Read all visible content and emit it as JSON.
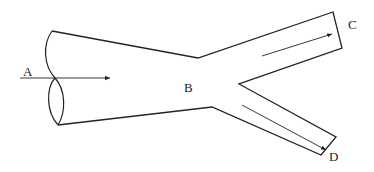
{
  "diagram": {
    "type": "branching pipe flow",
    "labels": {
      "A": "A",
      "B": "B",
      "C": "C",
      "D": "D"
    },
    "arrows": [
      {
        "name": "flow-arrow-a",
        "from": "inlet",
        "direction": "right"
      },
      {
        "name": "flow-arrow-c",
        "from": "junction",
        "to": "C",
        "direction": "up-right"
      },
      {
        "name": "flow-arrow-d",
        "from": "junction",
        "to": "D",
        "direction": "down-right"
      }
    ],
    "stroke_color": "#222222",
    "background": "#ffffff"
  }
}
